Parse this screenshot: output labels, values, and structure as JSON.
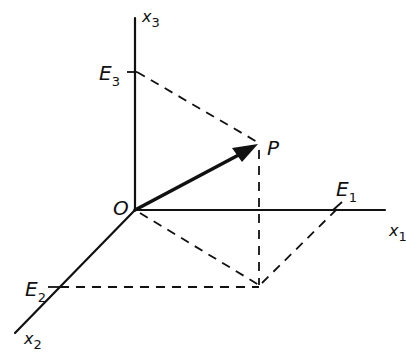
{
  "diagram": {
    "type": "3d-coordinate-vector",
    "axes": {
      "x1": {
        "label": "x",
        "subscript": "1"
      },
      "x2": {
        "label": "x",
        "subscript": "2"
      },
      "x3": {
        "label": "x",
        "subscript": "3"
      }
    },
    "origin": {
      "label": "O"
    },
    "point": {
      "label": "P"
    },
    "projections": {
      "E1": {
        "label": "E",
        "subscript": "1"
      },
      "E2": {
        "label": "E",
        "subscript": "2"
      },
      "E3": {
        "label": "E",
        "subscript": "3"
      }
    }
  }
}
